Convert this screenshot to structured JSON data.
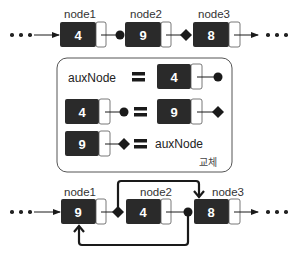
{
  "top_list": {
    "nodes": [
      {
        "label": "node1",
        "value": "4"
      },
      {
        "label": "node2",
        "value": "9"
      },
      {
        "label": "node3",
        "value": "8"
      }
    ],
    "link_markers": [
      "circle",
      "diamond"
    ]
  },
  "swap_box": {
    "rows": [
      {
        "left": "auxNode",
        "equals": "=",
        "right_value": "4",
        "right_marker": "circle"
      },
      {
        "left_value": "4",
        "left_marker": "circle",
        "equals": "=",
        "right_value": "9",
        "right_marker": "diamond"
      },
      {
        "left_value": "9",
        "left_marker": "diamond",
        "equals": "=",
        "right": "auxNode"
      }
    ],
    "caption": "교체"
  },
  "bottom_list": {
    "nodes": [
      {
        "label": "node1",
        "value": "9"
      },
      {
        "label": "node2",
        "value": "4"
      },
      {
        "label": "node3",
        "value": "8"
      }
    ],
    "link_markers": [
      "diamond",
      "circle"
    ]
  },
  "colors": {
    "node_fill": "#2a2a2a",
    "node_pointer_fill": "#ffffff",
    "stroke": "#1a1a1a",
    "box_border": "#555555"
  }
}
